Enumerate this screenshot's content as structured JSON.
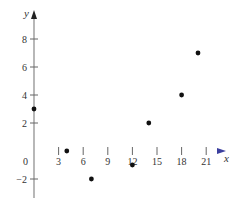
{
  "chart_data": {
    "type": "scatter",
    "title": "",
    "xlabel": "x",
    "ylabel": "y",
    "xlim": [
      -4,
      23
    ],
    "ylim": [
      -3.5,
      9.5
    ],
    "x_ticks": [
      3,
      6,
      9,
      12,
      15,
      18,
      21
    ],
    "y_ticks": [
      -2,
      2,
      4,
      6,
      8
    ],
    "origin_label": "0",
    "grid": false,
    "series": [
      {
        "name": "points",
        "points": [
          {
            "x": 0,
            "y": 3
          },
          {
            "x": 4,
            "y": 0
          },
          {
            "x": 7,
            "y": -2
          },
          {
            "x": 12,
            "y": -1
          },
          {
            "x": 14,
            "y": 2
          },
          {
            "x": 18,
            "y": 4
          },
          {
            "x": 20,
            "y": 7
          }
        ]
      }
    ],
    "colors": {
      "axis": "#555555",
      "x_axis_accent": "#6a6fd0",
      "point": "#111111"
    }
  }
}
